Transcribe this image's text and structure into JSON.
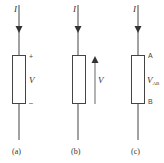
{
  "diagram": {
    "panels": [
      {
        "id": "a",
        "caption": "(a)",
        "current_label": "I",
        "voltage_label": "V",
        "top_terminal": "+",
        "bottom_terminal": "–"
      },
      {
        "id": "b",
        "caption": "(b)",
        "current_label": "I",
        "voltage_label": "V",
        "voltage_arrow": "up"
      },
      {
        "id": "c",
        "caption": "(c)",
        "current_label": "I",
        "voltage_label": "V",
        "voltage_subscript": "AB",
        "top_terminal": "A",
        "bottom_terminal": "B"
      }
    ],
    "colors": {
      "line": "#444444",
      "text": "#333333",
      "background": "#ffffff"
    }
  }
}
